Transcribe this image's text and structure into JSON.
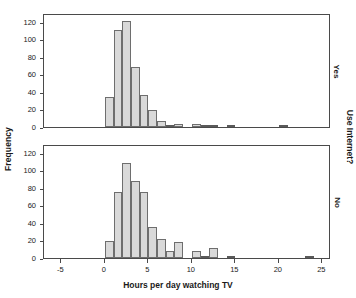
{
  "figure": {
    "y_axis_label": "Frequency",
    "x_axis_label": "Hours per day watching TV",
    "panel_group_label": "Use Internet?",
    "panel_top_label": "Yes",
    "panel_bottom_label": "No"
  },
  "chart_data": {
    "type": "bar",
    "title": "",
    "subtitle": "",
    "xlabel": "Hours per day watching TV",
    "ylabel": "Frequency",
    "grid": false,
    "legend_position": "right",
    "panel_variable": "Use Internet?",
    "bin_width": 1,
    "xlim": [
      -7,
      26
    ],
    "ylim": [
      0,
      130
    ],
    "xticks": [
      -5,
      0,
      5,
      10,
      15,
      20,
      25
    ],
    "yticks": [
      0,
      20,
      40,
      60,
      80,
      100,
      120
    ],
    "panels": [
      {
        "name": "Yes",
        "bin_centers": [
          0.5,
          1.5,
          2.5,
          3.5,
          4.5,
          5.5,
          6.5,
          7.5,
          8.5,
          9.5,
          10.5,
          11.5,
          12.5,
          14.5,
          20.5
        ],
        "values": [
          34,
          111,
          121,
          69,
          37,
          19,
          7,
          2,
          4,
          0,
          4,
          1,
          2,
          1,
          1
        ]
      },
      {
        "name": "No",
        "bin_centers": [
          0.5,
          1.5,
          2.5,
          3.5,
          4.5,
          5.5,
          6.5,
          7.5,
          8.5,
          9.5,
          10.5,
          11.5,
          12.5,
          13.5,
          14.5,
          23.5
        ],
        "values": [
          19,
          75,
          108,
          88,
          75,
          35,
          22,
          8,
          18,
          0,
          8,
          2,
          11,
          0,
          2,
          1
        ]
      }
    ]
  }
}
